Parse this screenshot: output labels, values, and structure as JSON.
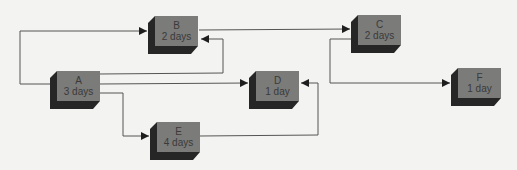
{
  "diagram": {
    "type": "activity-network",
    "colors": {
      "background": "#f3f3f1",
      "node_face": "#7b7b79",
      "node_shadow": "#262626",
      "line": "#444444",
      "text": "#3a3a3a"
    },
    "nodes": [
      {
        "id": "A",
        "label": "A",
        "duration": "3 days",
        "x": 57,
        "y": 71
      },
      {
        "id": "B",
        "label": "B",
        "duration": "2 days",
        "x": 155,
        "y": 16
      },
      {
        "id": "C",
        "label": "C",
        "duration": "2 days",
        "x": 358,
        "y": 15
      },
      {
        "id": "D",
        "label": "D",
        "duration": "1 day",
        "x": 256,
        "y": 71
      },
      {
        "id": "E",
        "label": "E",
        "duration": "4 days",
        "x": 157,
        "y": 122
      },
      {
        "id": "F",
        "label": "F",
        "duration": "1 day",
        "x": 458,
        "y": 68
      }
    ],
    "edges": [
      {
        "from": "A",
        "to": "B",
        "route": "A left -> up -> B left"
      },
      {
        "from": "A",
        "to": "B",
        "route": "A right -> up -> B right"
      },
      {
        "from": "A",
        "to": "D",
        "route": "A right -> D left"
      },
      {
        "from": "A",
        "to": "E",
        "route": "A right -> down -> E left"
      },
      {
        "from": "B",
        "to": "C",
        "route": "B right -> C left"
      },
      {
        "from": "C",
        "to": "F",
        "route": "C left -> down -> F left"
      },
      {
        "from": "E",
        "to": "D",
        "route": "E right -> up -> D right"
      }
    ]
  }
}
